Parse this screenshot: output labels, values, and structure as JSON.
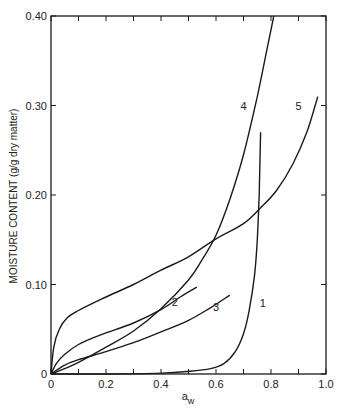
{
  "chart_data": {
    "type": "line",
    "title": "",
    "xlabel": "a_w",
    "xlabel_main": "a",
    "xlabel_sub": "w",
    "ylabel": "MOISTURE CONTENT (g/g dry matter)",
    "xlim": [
      0,
      1.0
    ],
    "ylim": [
      0,
      0.4
    ],
    "grid": false,
    "legend": "inline curve numbers",
    "x_ticks": [
      0,
      0.1,
      0.2,
      0.3,
      0.4,
      0.5,
      0.6,
      0.7,
      0.8,
      0.9,
      1.0
    ],
    "x_tick_labels": [
      "0",
      "0.2",
      "0.4",
      "0.6",
      "0.8",
      "1.0"
    ],
    "y_ticks": [
      0,
      0.1,
      0.2,
      0.3,
      0.4
    ],
    "y_tick_labels": [
      "0",
      "0.10",
      "0.20",
      "0.30",
      "0.40"
    ],
    "series": [
      {
        "name": "1",
        "label_pos": [
          0.77,
          0.075
        ],
        "points": [
          [
            0,
            0
          ],
          [
            0.2,
            0.0
          ],
          [
            0.4,
            0.001
          ],
          [
            0.5,
            0.003
          ],
          [
            0.58,
            0.006
          ],
          [
            0.63,
            0.012
          ],
          [
            0.67,
            0.025
          ],
          [
            0.7,
            0.045
          ],
          [
            0.72,
            0.07
          ],
          [
            0.74,
            0.11
          ],
          [
            0.75,
            0.15
          ],
          [
            0.757,
            0.2
          ],
          [
            0.76,
            0.24
          ],
          [
            0.762,
            0.27
          ]
        ]
      },
      {
        "name": "2",
        "label_pos": [
          0.45,
          0.076
        ],
        "points": [
          [
            0,
            0
          ],
          [
            0.02,
            0.012
          ],
          [
            0.05,
            0.022
          ],
          [
            0.1,
            0.033
          ],
          [
            0.15,
            0.04
          ],
          [
            0.2,
            0.046
          ],
          [
            0.3,
            0.057
          ],
          [
            0.4,
            0.072
          ],
          [
            0.47,
            0.086
          ],
          [
            0.53,
            0.097
          ]
        ]
      },
      {
        "name": "3",
        "label_pos": [
          0.6,
          0.07
        ],
        "points": [
          [
            0,
            0
          ],
          [
            0.05,
            0.01
          ],
          [
            0.1,
            0.016
          ],
          [
            0.2,
            0.025
          ],
          [
            0.3,
            0.035
          ],
          [
            0.4,
            0.047
          ],
          [
            0.5,
            0.06
          ],
          [
            0.58,
            0.074
          ],
          [
            0.65,
            0.088
          ]
        ]
      },
      {
        "name": "4",
        "label_pos": [
          0.7,
          0.295
        ],
        "points": [
          [
            0,
            0
          ],
          [
            0.05,
            0.006
          ],
          [
            0.1,
            0.013
          ],
          [
            0.2,
            0.03
          ],
          [
            0.3,
            0.048
          ],
          [
            0.4,
            0.073
          ],
          [
            0.5,
            0.105
          ],
          [
            0.55,
            0.128
          ],
          [
            0.6,
            0.155
          ],
          [
            0.65,
            0.195
          ],
          [
            0.7,
            0.245
          ],
          [
            0.75,
            0.31
          ],
          [
            0.79,
            0.37
          ],
          [
            0.81,
            0.4
          ]
        ]
      },
      {
        "name": "5",
        "label_pos": [
          0.9,
          0.295
        ],
        "points": [
          [
            0,
            0
          ],
          [
            0.01,
            0.03
          ],
          [
            0.03,
            0.05
          ],
          [
            0.06,
            0.063
          ],
          [
            0.1,
            0.071
          ],
          [
            0.2,
            0.086
          ],
          [
            0.3,
            0.1
          ],
          [
            0.4,
            0.116
          ],
          [
            0.5,
            0.131
          ],
          [
            0.6,
            0.151
          ],
          [
            0.7,
            0.168
          ],
          [
            0.76,
            0.185
          ],
          [
            0.82,
            0.205
          ],
          [
            0.88,
            0.235
          ],
          [
            0.93,
            0.27
          ],
          [
            0.97,
            0.31
          ]
        ]
      }
    ]
  },
  "layout": {
    "plot_left": 51,
    "plot_right": 326,
    "plot_top": 16,
    "plot_bottom": 374,
    "line_color": "#1a1a1a"
  }
}
